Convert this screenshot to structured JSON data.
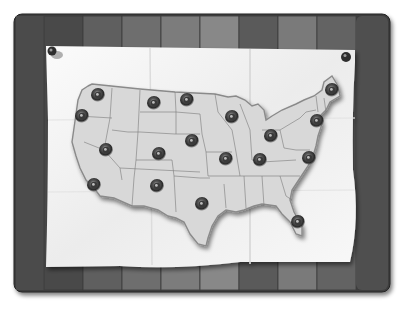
{
  "illustration": {
    "subject": "Folded paper map of the United States pinned to a wooden board",
    "colors": {
      "background": "#ffffff",
      "board_dark": "#3c3c3c",
      "board_light": "#8a8a8a",
      "paper": "#f4f4f4",
      "land": "#d9d9d9",
      "state_border": "#6e6e6e",
      "pin": "#3a3a3a"
    },
    "thumbtacks": [
      {
        "name": "top-left-tack"
      },
      {
        "name": "top-right-tack"
      }
    ],
    "location_pins": [
      {
        "state": "Washington"
      },
      {
        "state": "Oregon"
      },
      {
        "state": "Montana"
      },
      {
        "state": "North Dakota"
      },
      {
        "state": "Nevada"
      },
      {
        "state": "Colorado"
      },
      {
        "state": "Nebraska"
      },
      {
        "state": "Wisconsin"
      },
      {
        "state": "Ohio"
      },
      {
        "state": "Maine"
      },
      {
        "state": "New York"
      },
      {
        "state": "California"
      },
      {
        "state": "New Mexico"
      },
      {
        "state": "Missouri"
      },
      {
        "state": "Kentucky"
      },
      {
        "state": "North Carolina"
      },
      {
        "state": "Texas"
      },
      {
        "state": "Florida"
      }
    ]
  }
}
